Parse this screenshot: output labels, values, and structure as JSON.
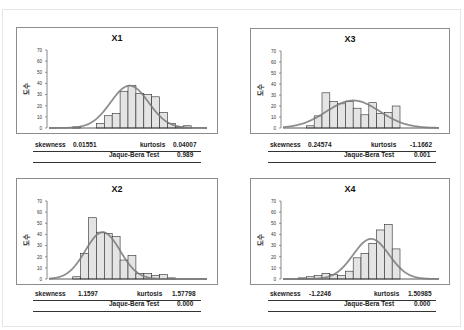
{
  "y_axis_label": "도수",
  "labels": {
    "skewness": "skewness",
    "kurtosis": "kurtosis",
    "jb": "Jaque-Bera Test"
  },
  "colors": {
    "bar_fill": "#e4e4e4",
    "bar_stroke": "#2a2a2a",
    "curve": "#7a7a7a",
    "axis": "#555555"
  },
  "panels": [
    {
      "id": "X1",
      "title": "X1",
      "skewness": "0.01551",
      "kurtosis": "0.04007",
      "jb": "0.989"
    },
    {
      "id": "X3",
      "title": "X3",
      "skewness": "0.24574",
      "kurtosis": "-1.1662",
      "jb": "0.001"
    },
    {
      "id": "X2",
      "title": "X2",
      "skewness": "1.1597",
      "kurtosis": "1.57798",
      "jb": "0.000"
    },
    {
      "id": "X4",
      "title": "X4",
      "skewness": "-1.2246",
      "kurtosis": "1.50985",
      "jb": "0.000"
    }
  ],
  "chart_data": [
    {
      "type": "bar",
      "title": "X1",
      "ylabel": "도수",
      "ylim": [
        0,
        70
      ],
      "yticks": [
        0,
        10,
        20,
        30,
        40,
        50,
        60,
        70
      ],
      "bins": 20,
      "values": [
        0,
        0,
        0,
        1,
        0,
        0,
        4,
        11,
        13,
        33,
        38,
        31,
        30,
        28,
        14,
        4,
        1,
        2,
        0,
        0
      ],
      "normal_curve": {
        "mean_bin": 10.2,
        "sd_bins": 2.4,
        "peak": 38
      },
      "skewness": 0.01551,
      "kurtosis": 0.04007,
      "jarque_bera_p": 0.989
    },
    {
      "type": "bar",
      "title": "X3",
      "ylabel": "도수",
      "ylim": [
        0,
        70
      ],
      "yticks": [
        0,
        10,
        20,
        30,
        40,
        50,
        60,
        70
      ],
      "bins": 20,
      "values": [
        0,
        0,
        0,
        2,
        11,
        32,
        24,
        22,
        24,
        18,
        12,
        23,
        13,
        14,
        20,
        0,
        0,
        0,
        0,
        0
      ],
      "normal_curve": {
        "mean_bin": 9.0,
        "sd_bins": 3.4,
        "peak": 25
      },
      "skewness": 0.24574,
      "kurtosis": -1.1662,
      "jarque_bera_p": 0.001
    },
    {
      "type": "bar",
      "title": "X2",
      "ylabel": "도수",
      "ylim": [
        0,
        70
      ],
      "yticks": [
        0,
        10,
        20,
        30,
        40,
        50,
        60,
        70
      ],
      "bins": 20,
      "values": [
        0,
        0,
        0,
        2,
        23,
        55,
        42,
        41,
        38,
        17,
        21,
        5,
        5,
        3,
        4,
        1,
        0,
        0,
        0,
        0
      ],
      "normal_curve": {
        "mean_bin": 6.8,
        "sd_bins": 2.2,
        "peak": 42
      },
      "skewness": 1.1597,
      "kurtosis": 1.57798,
      "jarque_bera_p": 0.0
    },
    {
      "type": "bar",
      "title": "X4",
      "ylabel": "doshu",
      "ylim": [
        0,
        70
      ],
      "yticks": [
        0,
        10,
        20,
        30,
        40,
        50,
        60,
        70
      ],
      "bins": 20,
      "values": [
        0,
        0,
        1,
        2,
        3,
        5,
        4,
        3,
        7,
        19,
        23,
        32,
        44,
        49,
        27,
        0,
        0,
        0,
        0,
        0
      ],
      "normal_curve": {
        "mean_bin": 11.3,
        "sd_bins": 2.3,
        "peak": 36
      },
      "skewness": -1.2246,
      "kurtosis": 1.50985,
      "jarque_bera_p": 0.0
    }
  ]
}
